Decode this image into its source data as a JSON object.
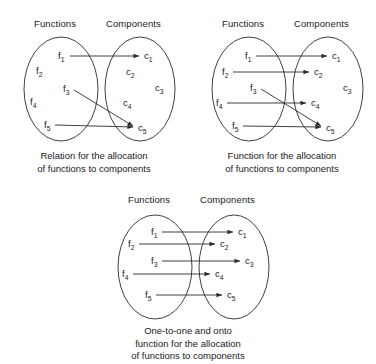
{
  "figure": {
    "background_color": "#ffffff",
    "line_color": "#2b2b2b",
    "text_color": "#1a1a1a"
  },
  "columns": {
    "left_header": "Functions",
    "right_header": "Components"
  },
  "nodes": {
    "functions": [
      {
        "id": "f1",
        "base": "f",
        "sub": "1"
      },
      {
        "id": "f2",
        "base": "f",
        "sub": "2"
      },
      {
        "id": "f3",
        "base": "f",
        "sub": "3"
      },
      {
        "id": "f4",
        "base": "f",
        "sub": "4"
      },
      {
        "id": "f5",
        "base": "f",
        "sub": "5"
      }
    ],
    "components": [
      {
        "id": "c1",
        "base": "c",
        "sub": "1"
      },
      {
        "id": "c2",
        "base": "c",
        "sub": "2"
      },
      {
        "id": "c3",
        "base": "c",
        "sub": "3"
      },
      {
        "id": "c4",
        "base": "c",
        "sub": "4"
      },
      {
        "id": "c5",
        "base": "c",
        "sub": "5"
      }
    ]
  },
  "panels": [
    {
      "key": "relation",
      "caption_lines": [
        "Relation for the allocation",
        "of functions to components"
      ],
      "mappings": [
        {
          "from": "f1",
          "to": "c1"
        },
        {
          "from": "f3",
          "to": "c5"
        },
        {
          "from": "f5",
          "to": "c5"
        }
      ]
    },
    {
      "key": "function",
      "caption_lines": [
        "Function for the allocation",
        "of functions to components"
      ],
      "mappings": [
        {
          "from": "f1",
          "to": "c1"
        },
        {
          "from": "f2",
          "to": "c2"
        },
        {
          "from": "f3",
          "to": "c5"
        },
        {
          "from": "f4",
          "to": "c4"
        },
        {
          "from": "f5",
          "to": "c5"
        }
      ]
    },
    {
      "key": "bijection",
      "caption_lines": [
        "One-to-one and onto",
        "function for the allocation",
        "of functions to components"
      ],
      "mappings": [
        {
          "from": "f1",
          "to": "c1"
        },
        {
          "from": "f2",
          "to": "c2"
        },
        {
          "from": "f3",
          "to": "c3"
        },
        {
          "from": "f4",
          "to": "c4"
        },
        {
          "from": "f5",
          "to": "c5"
        }
      ]
    }
  ]
}
